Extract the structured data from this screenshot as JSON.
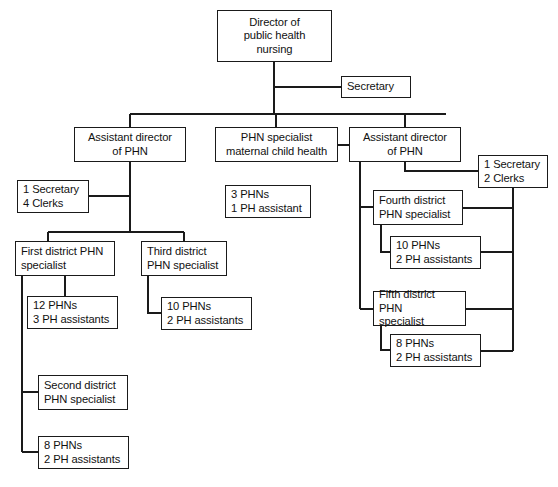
{
  "chart_data": {
    "type": "diagram",
    "diagram_kind": "organizational-hierarchy",
    "background_color": "#ffffff",
    "line_color": "#1a1a1a",
    "box_border_color": "#1a1a1a",
    "box_fill_color": "#ffffff",
    "nodes": [
      {
        "id": "director",
        "lines": [
          "Director of",
          "public health",
          "nursing"
        ],
        "align": "center",
        "x": 217,
        "y": 10,
        "w": 115,
        "h": 52,
        "level": 0,
        "parent": null
      },
      {
        "id": "secretary-top",
        "lines": [
          "Secretary"
        ],
        "align": "left",
        "x": 341,
        "y": 76,
        "w": 70,
        "h": 22,
        "level": 1,
        "parent": "director"
      },
      {
        "id": "assistant-director-left",
        "lines": [
          "Assistant director",
          "of PHN"
        ],
        "align": "center",
        "x": 74,
        "y": 127,
        "w": 112,
        "h": 35,
        "level": 1,
        "parent": "director"
      },
      {
        "id": "phn-specialist-mch",
        "lines": [
          "PHN specialist",
          "maternal child health"
        ],
        "align": "center",
        "x": 215,
        "y": 127,
        "w": 123,
        "h": 35,
        "level": 1,
        "parent": "director"
      },
      {
        "id": "assistant-director-right",
        "lines": [
          "Assistant director",
          "of PHN"
        ],
        "align": "center",
        "x": 349,
        "y": 127,
        "w": 112,
        "h": 35,
        "level": 1,
        "parent": "director"
      },
      {
        "id": "staff-left-adm",
        "lines": [
          "1 Secretary",
          "4 Clerks"
        ],
        "align": "left",
        "x": 17,
        "y": 180,
        "w": 72,
        "h": 33,
        "level": 2,
        "parent": "assistant-director-left"
      },
      {
        "id": "staff-right-adm",
        "lines": [
          "1 Secretary",
          "2 Clerks"
        ],
        "align": "left",
        "x": 478,
        "y": 155,
        "w": 70,
        "h": 33,
        "level": 2,
        "parent": "assistant-director-right"
      },
      {
        "id": "staff-mch",
        "lines": [
          "3 PHNs",
          "1 PH assistant"
        ],
        "align": "left",
        "x": 225,
        "y": 185,
        "w": 86,
        "h": 33,
        "level": 2,
        "parent": "phn-specialist-mch"
      },
      {
        "id": "first-district",
        "lines": [
          "First district PHN",
          "specialist"
        ],
        "align": "left",
        "x": 15,
        "y": 241,
        "w": 100,
        "h": 35,
        "level": 2,
        "parent": "assistant-director-left"
      },
      {
        "id": "third-district",
        "lines": [
          "Third district",
          "PHN specialist"
        ],
        "align": "left",
        "x": 141,
        "y": 241,
        "w": 86,
        "h": 35,
        "level": 2,
        "parent": "assistant-director-left"
      },
      {
        "id": "fourth-district",
        "lines": [
          "Fourth district",
          "PHN specialist"
        ],
        "align": "left",
        "x": 373,
        "y": 190,
        "w": 90,
        "h": 35,
        "level": 2,
        "parent": "assistant-director-right"
      },
      {
        "id": "fifth-district",
        "lines": [
          "Fifth district PHN",
          "specialist"
        ],
        "align": "left",
        "x": 373,
        "y": 291,
        "w": 93,
        "h": 35,
        "level": 2,
        "parent": "assistant-director-right"
      },
      {
        "id": "staff-first-district",
        "lines": [
          "12 PHNs",
          "3 PH assistants"
        ],
        "align": "left",
        "x": 27,
        "y": 296,
        "w": 91,
        "h": 33,
        "level": 3,
        "parent": "first-district"
      },
      {
        "id": "staff-third-district",
        "lines": [
          "10 PHNs",
          "2 PH assistants"
        ],
        "align": "left",
        "x": 161,
        "y": 297,
        "w": 91,
        "h": 33,
        "level": 3,
        "parent": "third-district"
      },
      {
        "id": "staff-fourth-district",
        "lines": [
          "10 PHNs",
          "2 PH assistants"
        ],
        "align": "left",
        "x": 390,
        "y": 236,
        "w": 91,
        "h": 33,
        "level": 3,
        "parent": "fourth-district"
      },
      {
        "id": "staff-fifth-district",
        "lines": [
          "8 PHNs",
          "2 PH assistants"
        ],
        "align": "left",
        "x": 390,
        "y": 334,
        "w": 91,
        "h": 33,
        "level": 3,
        "parent": "fifth-district"
      },
      {
        "id": "second-district",
        "lines": [
          "Second district",
          "PHN specialist"
        ],
        "align": "left",
        "x": 38,
        "y": 375,
        "w": 90,
        "h": 35,
        "level": 3,
        "parent": "first-district"
      },
      {
        "id": "staff-second-district",
        "lines": [
          "8 PHNs",
          "2 PH assistants"
        ],
        "align": "left",
        "x": 38,
        "y": 436,
        "w": 91,
        "h": 33,
        "level": 4,
        "parent": "first-district"
      }
    ],
    "connectors": [
      {
        "id": "director-down-stub",
        "from": "director",
        "to": "secretary-top",
        "points": "274,62 274,87 341,87"
      },
      {
        "id": "director-to-bus",
        "from": "director",
        "to": "distribution-bus",
        "points": "274,87 274,114"
      },
      {
        "id": "distribution-bus",
        "from": "director",
        "to": "level1-row",
        "points": "130,114 446,114"
      },
      {
        "id": "bus-to-adm-left",
        "from": "distribution-bus",
        "to": "assistant-director-left",
        "points": "130,114 130,127"
      },
      {
        "id": "bus-to-mch",
        "from": "distribution-bus",
        "to": "phn-specialist-mch",
        "points": "276,114 276,127"
      },
      {
        "id": "bus-to-adm-right",
        "from": "distribution-bus",
        "to": "assistant-director-right",
        "points": "405,114 405,127"
      },
      {
        "id": "mch-to-adm-right",
        "from": "phn-specialist-mch",
        "to": "assistant-director-right",
        "points": "338,145 349,145"
      },
      {
        "id": "adm-left-spine",
        "from": "assistant-director-left",
        "to": "children",
        "points": "130,162 130,232"
      },
      {
        "id": "adm-left-to-staff",
        "from": "assistant-director-left",
        "to": "staff-left-adm",
        "points": "89,196 130,196"
      },
      {
        "id": "adm-left-child-bus",
        "from": "assistant-director-left",
        "to": "district-row",
        "points": "48,232 184,232"
      },
      {
        "id": "bus-to-first",
        "from": "adm-left-child-bus",
        "to": "first-district",
        "points": "48,232 48,241"
      },
      {
        "id": "bus-to-third",
        "from": "adm-left-child-bus",
        "to": "third-district",
        "points": "184,232 184,241"
      },
      {
        "id": "first-to-staff",
        "from": "first-district",
        "to": "staff-first-district",
        "points": "65,276 65,296"
      },
      {
        "id": "third-to-staff",
        "from": "third-district",
        "to": "staff-third-district",
        "points": "148,276 148,313 161,313"
      },
      {
        "id": "first-spine-down",
        "from": "first-district",
        "to": "second-district",
        "points": "22,276 22,452"
      },
      {
        "id": "spine-to-second",
        "from": "first-spine-down",
        "to": "second-district",
        "points": "22,392 38,392"
      },
      {
        "id": "spine-to-second-staff",
        "from": "first-spine-down",
        "to": "staff-second-district",
        "points": "22,452 38,452"
      },
      {
        "id": "adm-right-spine",
        "from": "assistant-director-right",
        "to": "children",
        "points": "360,162 360,309"
      },
      {
        "id": "adm-right-to-staff",
        "from": "assistant-director-right",
        "to": "staff-right-adm",
        "points": "405,162 405,171 478,171"
      },
      {
        "id": "adm-right-to-fourth",
        "from": "assistant-director-right",
        "to": "fourth-district",
        "points": "360,207 373,207"
      },
      {
        "id": "adm-right-to-fifth",
        "from": "assistant-director-right",
        "to": "fifth-district",
        "points": "360,309 373,309"
      },
      {
        "id": "fourth-to-staff",
        "from": "fourth-district",
        "to": "staff-fourth-district",
        "points": "381,225 381,252 390,252"
      },
      {
        "id": "fifth-to-staff",
        "from": "fifth-district",
        "to": "staff-fifth-district",
        "points": "381,326 381,350 390,350"
      },
      {
        "id": "right-return-spine",
        "from": "staff-right-adm",
        "to": "district-returns",
        "points": "513,188 513,351"
      },
      {
        "id": "fourth-return",
        "from": "fourth-district",
        "to": "right-return-spine",
        "points": "463,208 513,208"
      },
      {
        "id": "staff-fourth-return",
        "from": "staff-fourth-district",
        "to": "right-return-spine",
        "points": "481,252 513,252"
      },
      {
        "id": "fifth-return",
        "from": "fifth-district",
        "to": "right-return-spine",
        "points": "466,309 513,309"
      },
      {
        "id": "staff-fifth-return",
        "from": "staff-fifth-district",
        "to": "right-return-spine",
        "points": "481,351 513,351"
      }
    ]
  }
}
